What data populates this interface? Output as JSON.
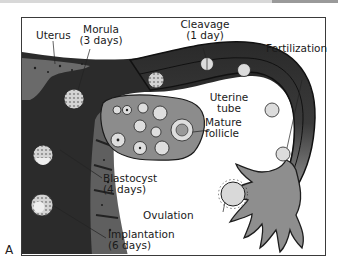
{
  "figure": {
    "panel_letter": "A",
    "labels": {
      "uterus": "Uterus",
      "morula_line1": "Morula",
      "morula_line2": "(3 days)",
      "cleavage_line1": "Cleavage",
      "cleavage_line2": "(1 day)",
      "fertilization": "Fertilization",
      "uterine_tube_line1": "Uterine",
      "uterine_tube_line2": "tube",
      "mature_follicle_line1": "Mature",
      "mature_follicle_line2": "follicle",
      "blastocyst_line1": "Blastocyst",
      "blastocyst_line2": "(4 days)",
      "ovulation": "Ovulation",
      "implantation_line1": "Implantation",
      "implantation_line2": "(6 days)"
    },
    "colors": {
      "tube_dark": "#2a2a2a",
      "tube_mid": "#6b6b6b",
      "tube_light": "#9a9a9a",
      "uterine_wall": "#5c5c5c",
      "ovary": "#8c8c8c",
      "cell": "#cfcfcf"
    }
  }
}
